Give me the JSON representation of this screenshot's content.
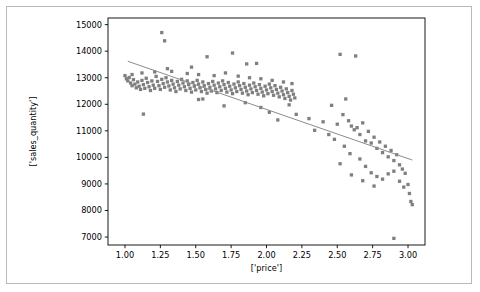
{
  "figure": {
    "background_color": "#ffffff",
    "border_color": "#b9b9b9",
    "marker_color": "#7f7f7f",
    "line_color": "#8c8c8c"
  },
  "chart_data": {
    "type": "scatter",
    "title": "",
    "xlabel": "['price']",
    "ylabel": "['sales_quantity']",
    "xlim": [
      0.88,
      3.12
    ],
    "ylim": [
      6700,
      15250
    ],
    "grid": false,
    "legend": null,
    "xticks": [
      1.0,
      1.25,
      1.5,
      1.75,
      2.0,
      2.25,
      2.5,
      2.75,
      3.0
    ],
    "xticklabels": [
      "1.00",
      "1.25",
      "1.50",
      "1.75",
      "2.00",
      "2.25",
      "2.50",
      "2.75",
      "3.00"
    ],
    "yticks": [
      7000,
      8000,
      9000,
      10000,
      11000,
      12000,
      13000,
      14000,
      15000
    ],
    "yticklabels": [
      "7000",
      "8000",
      "9000",
      "10000",
      "11000",
      "12000",
      "13000",
      "14000",
      "15000"
    ],
    "trendline": {
      "x": [
        1.02,
        3.03
      ],
      "y": [
        13620,
        9900
      ]
    },
    "series": [
      {
        "name": "observations",
        "marker": "square",
        "marker_size": 2.2,
        "points": [
          [
            1.0,
            13080
          ],
          [
            1.01,
            12960
          ],
          [
            1.02,
            12880
          ],
          [
            1.03,
            13010
          ],
          [
            1.04,
            12800
          ],
          [
            1.05,
            12700
          ],
          [
            1.06,
            12930
          ],
          [
            1.07,
            12760
          ],
          [
            1.08,
            12620
          ],
          [
            1.09,
            12840
          ],
          [
            1.1,
            12680
          ],
          [
            1.11,
            12560
          ],
          [
            1.12,
            12900
          ],
          [
            1.13,
            12740
          ],
          [
            1.14,
            12600
          ],
          [
            1.15,
            12980
          ],
          [
            1.16,
            12820
          ],
          [
            1.17,
            12660
          ],
          [
            1.18,
            12520
          ],
          [
            1.19,
            12880
          ],
          [
            1.2,
            12720
          ],
          [
            1.21,
            12600
          ],
          [
            1.22,
            13050
          ],
          [
            1.23,
            12860
          ],
          [
            1.24,
            12700
          ],
          [
            1.25,
            12560
          ],
          [
            1.26,
            12940
          ],
          [
            1.27,
            12780
          ],
          [
            1.28,
            12640
          ],
          [
            1.29,
            13000
          ],
          [
            1.3,
            12840
          ],
          [
            1.31,
            12690
          ],
          [
            1.32,
            12540
          ],
          [
            1.33,
            12900
          ],
          [
            1.34,
            12760
          ],
          [
            1.35,
            12620
          ],
          [
            1.36,
            12480
          ],
          [
            1.37,
            12860
          ],
          [
            1.38,
            12720
          ],
          [
            1.39,
            12580
          ],
          [
            1.4,
            12940
          ],
          [
            1.41,
            12800
          ],
          [
            1.42,
            12660
          ],
          [
            1.43,
            12520
          ],
          [
            1.44,
            12880
          ],
          [
            1.45,
            12740
          ],
          [
            1.46,
            12600
          ],
          [
            1.47,
            12460
          ],
          [
            1.48,
            12820
          ],
          [
            1.49,
            12680
          ],
          [
            1.5,
            12540
          ],
          [
            1.51,
            12900
          ],
          [
            1.52,
            12760
          ],
          [
            1.53,
            12620
          ],
          [
            1.54,
            12480
          ],
          [
            1.55,
            12840
          ],
          [
            1.56,
            12700
          ],
          [
            1.57,
            12560
          ],
          [
            1.58,
            12420
          ],
          [
            1.59,
            12780
          ],
          [
            1.6,
            12640
          ],
          [
            1.61,
            12500
          ],
          [
            1.62,
            12860
          ],
          [
            1.63,
            12720
          ],
          [
            1.64,
            12580
          ],
          [
            1.65,
            12440
          ],
          [
            1.66,
            12800
          ],
          [
            1.67,
            12660
          ],
          [
            1.68,
            12520
          ],
          [
            1.69,
            12880
          ],
          [
            1.7,
            12740
          ],
          [
            1.71,
            12600
          ],
          [
            1.72,
            12460
          ],
          [
            1.73,
            12820
          ],
          [
            1.74,
            12680
          ],
          [
            1.75,
            12540
          ],
          [
            1.76,
            12400
          ],
          [
            1.77,
            12760
          ],
          [
            1.78,
            12620
          ],
          [
            1.79,
            12480
          ],
          [
            1.8,
            12840
          ],
          [
            1.81,
            12700
          ],
          [
            1.82,
            12560
          ],
          [
            1.83,
            12420
          ],
          [
            1.84,
            12780
          ],
          [
            1.85,
            12640
          ],
          [
            1.86,
            12500
          ],
          [
            1.87,
            12360
          ],
          [
            1.88,
            12720
          ],
          [
            1.89,
            12580
          ],
          [
            1.9,
            12440
          ],
          [
            1.91,
            12800
          ],
          [
            1.92,
            12660
          ],
          [
            1.93,
            12520
          ],
          [
            1.94,
            12380
          ],
          [
            1.95,
            12740
          ],
          [
            1.96,
            12600
          ],
          [
            1.97,
            12460
          ],
          [
            1.98,
            12320
          ],
          [
            1.99,
            12680
          ],
          [
            2.0,
            12540
          ],
          [
            2.01,
            12400
          ],
          [
            2.02,
            12760
          ],
          [
            2.03,
            12620
          ],
          [
            2.04,
            12480
          ],
          [
            2.05,
            12340
          ],
          [
            2.06,
            12700
          ],
          [
            2.07,
            12560
          ],
          [
            2.08,
            12420
          ],
          [
            2.09,
            12280
          ],
          [
            2.1,
            12640
          ],
          [
            2.11,
            12500
          ],
          [
            2.12,
            12360
          ],
          [
            2.13,
            12220
          ],
          [
            2.14,
            12580
          ],
          [
            2.15,
            12440
          ],
          [
            2.16,
            12300
          ],
          [
            2.17,
            12160
          ],
          [
            2.18,
            12520
          ],
          [
            2.19,
            12380
          ],
          [
            2.2,
            12240
          ],
          [
            1.05,
            13120
          ],
          [
            1.12,
            13180
          ],
          [
            1.21,
            13220
          ],
          [
            1.33,
            13240
          ],
          [
            1.44,
            13160
          ],
          [
            1.52,
            13120
          ],
          [
            1.63,
            13080
          ],
          [
            1.71,
            13180
          ],
          [
            1.8,
            13060
          ],
          [
            1.88,
            13000
          ],
          [
            1.96,
            12960
          ],
          [
            2.04,
            12900
          ],
          [
            2.12,
            12840
          ],
          [
            2.18,
            12780
          ],
          [
            1.26,
            14700
          ],
          [
            1.28,
            14390
          ],
          [
            1.58,
            13790
          ],
          [
            1.76,
            13930
          ],
          [
            1.93,
            13540
          ],
          [
            2.52,
            13880
          ],
          [
            2.63,
            13820
          ],
          [
            1.3,
            13340
          ],
          [
            1.47,
            13400
          ],
          [
            1.86,
            13520
          ],
          [
            1.13,
            11630
          ],
          [
            1.52,
            12180
          ],
          [
            1.55,
            12200
          ],
          [
            1.7,
            11940
          ],
          [
            1.85,
            12060
          ],
          [
            1.96,
            11880
          ],
          [
            2.02,
            11700
          ],
          [
            2.08,
            11410
          ],
          [
            2.16,
            11980
          ],
          [
            2.21,
            11620
          ],
          [
            2.46,
            11960
          ],
          [
            2.5,
            11250
          ],
          [
            2.54,
            11610
          ],
          [
            2.58,
            11380
          ],
          [
            2.6,
            11180
          ],
          [
            2.62,
            11040
          ],
          [
            2.64,
            11120
          ],
          [
            2.66,
            10860
          ],
          [
            2.68,
            11300
          ],
          [
            2.7,
            10620
          ],
          [
            2.72,
            10980
          ],
          [
            2.74,
            10540
          ],
          [
            2.76,
            10760
          ],
          [
            2.78,
            10340
          ],
          [
            2.8,
            10580
          ],
          [
            2.82,
            10180
          ],
          [
            2.84,
            10420
          ],
          [
            2.86,
            10020
          ],
          [
            2.88,
            10260
          ],
          [
            2.9,
            9880
          ],
          [
            2.92,
            10100
          ],
          [
            2.94,
            9720
          ],
          [
            2.96,
            9560
          ],
          [
            2.98,
            9400
          ],
          [
            3.0,
            8980
          ],
          [
            3.01,
            8640
          ],
          [
            3.02,
            8340
          ],
          [
            3.03,
            8220
          ],
          [
            2.48,
            10680
          ],
          [
            2.55,
            10420
          ],
          [
            2.59,
            10140
          ],
          [
            2.66,
            9940
          ],
          [
            2.7,
            9660
          ],
          [
            2.74,
            9420
          ],
          [
            2.78,
            9280
          ],
          [
            2.82,
            9180
          ],
          [
            2.86,
            9380
          ],
          [
            2.9,
            9480
          ],
          [
            2.94,
            9100
          ],
          [
            2.97,
            8880
          ],
          [
            2.52,
            9760
          ],
          [
            2.6,
            9340
          ],
          [
            2.68,
            9120
          ],
          [
            2.76,
            8920
          ],
          [
            2.4,
            11340
          ],
          [
            2.44,
            10860
          ],
          [
            2.56,
            12200
          ],
          [
            2.9,
            6950
          ],
          [
            2.3,
            11460
          ],
          [
            2.34,
            11020
          ]
        ]
      }
    ]
  }
}
